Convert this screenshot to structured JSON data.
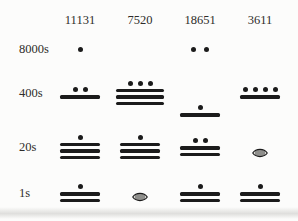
{
  "colors": {
    "glyph": "#1b1b1b",
    "text": "#2e2c2a",
    "background": "#fcfcfb"
  },
  "table": {
    "column_headers": [
      "11131",
      "7520",
      "18651",
      "3611"
    ],
    "row_labels": [
      "8000s",
      "400s",
      "20s",
      "1s"
    ],
    "cells": [
      [
        {
          "dots": 1,
          "bars": 0,
          "value": 1
        },
        null,
        {
          "dots": 2,
          "bars": 0,
          "value": 2
        },
        null
      ],
      [
        {
          "dots": 2,
          "bars": 1,
          "value": 7
        },
        {
          "dots": 3,
          "bars": 3,
          "value": 18
        },
        {
          "dots": 1,
          "bars": 1,
          "value": 6
        },
        {
          "dots": 4,
          "bars": 1,
          "value": 9
        }
      ],
      [
        {
          "dots": 1,
          "bars": 3,
          "value": 16
        },
        {
          "dots": 1,
          "bars": 3,
          "value": 16
        },
        {
          "dots": 2,
          "bars": 2,
          "value": 12
        },
        {
          "shell": true,
          "value": 0
        }
      ],
      [
        {
          "dots": 1,
          "bars": 2,
          "value": 11
        },
        {
          "shell": true,
          "value": 0
        },
        {
          "dots": 1,
          "bars": 2,
          "value": 11
        },
        {
          "dots": 1,
          "bars": 2,
          "value": 11
        }
      ]
    ]
  }
}
